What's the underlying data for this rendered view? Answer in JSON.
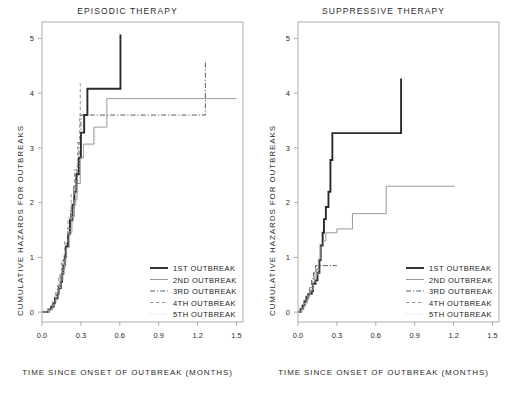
{
  "figure": {
    "axis_label_y": "CUMULATIVE  HAZARDS  FOR  OUTBREAKS",
    "axis_label_x": "TIME SINCE ONSET OF OUTBREAK  (MONTHS)",
    "colors": {
      "series1": "#2a2a2a",
      "series2": "#8c8c8c",
      "series3": "#4a4a4a",
      "series4": "#8a8a8a",
      "series5": "#c8c8c8",
      "frame": "#9a9a9a",
      "text": "#2b2b2b"
    }
  },
  "panels": [
    {
      "key": "episodic",
      "title": "EPISODIC  THERAPY",
      "legend": [
        {
          "label": "1ST  OUTBREAK",
          "style": "solid-thick"
        },
        {
          "label": "2ND  OUTBREAK",
          "style": "solid-thin"
        },
        {
          "label": "3RD  OUTBREAK",
          "style": "dashdot"
        },
        {
          "label": "4TH  OUTBREAK",
          "style": "dashed"
        },
        {
          "label": "5TH  OUTBREAK",
          "style": "dotted"
        }
      ]
    },
    {
      "key": "suppressive",
      "title": "SUPPRESSIVE  THERAPY",
      "legend": [
        {
          "label": "1ST  OUTBREAK",
          "style": "solid-thick"
        },
        {
          "label": "2ND  OUTBREAK",
          "style": "solid-thin"
        },
        {
          "label": "3RD  OUTBREAK",
          "style": "dashdot"
        },
        {
          "label": "4TH  OUTBREAK",
          "style": "dashed"
        },
        {
          "label": "5TH  OUTBREAK",
          "style": "dotted"
        }
      ]
    }
  ],
  "chart_data": [
    {
      "type": "line",
      "subtype": "step",
      "title": "EPISODIC  THERAPY",
      "xlabel": "TIME SINCE ONSET OF OUTBREAK  (MONTHS)",
      "ylabel": "CUMULATIVE  HAZARDS  FOR  OUTBREAKS",
      "xlim": [
        0.0,
        1.55
      ],
      "ylim": [
        -0.18,
        5.3
      ],
      "xticks": [
        0.0,
        0.3,
        0.6,
        0.9,
        1.2,
        1.5
      ],
      "xticklabels": [
        "0.0",
        "0.3",
        "0.6",
        "0.9",
        "1.2",
        "1.5"
      ],
      "yticks": [
        0,
        1,
        2,
        3,
        4,
        5
      ],
      "yticklabels": [
        "0",
        "1",
        "2",
        "3",
        "4",
        "5"
      ],
      "grid": false,
      "legend_position": "lower-right-inside",
      "series": [
        {
          "name": "1ST  OUTBREAK",
          "style": "solid-thick",
          "color": "#2a2a2a",
          "points": [
            [
              0.0,
              0.0
            ],
            [
              0.04,
              0.0
            ],
            [
              0.05,
              0.05
            ],
            [
              0.07,
              0.1
            ],
            [
              0.09,
              0.17
            ],
            [
              0.1,
              0.25
            ],
            [
              0.12,
              0.34
            ],
            [
              0.13,
              0.44
            ],
            [
              0.145,
              0.56
            ],
            [
              0.155,
              0.7
            ],
            [
              0.165,
              0.85
            ],
            [
              0.175,
              1.02
            ],
            [
              0.185,
              1.2
            ],
            [
              0.2,
              1.42
            ],
            [
              0.215,
              1.68
            ],
            [
              0.235,
              1.96
            ],
            [
              0.25,
              2.2
            ],
            [
              0.265,
              2.52
            ],
            [
              0.285,
              2.82
            ],
            [
              0.3,
              3.28
            ],
            [
              0.325,
              3.6
            ],
            [
              0.35,
              4.08
            ],
            [
              0.6,
              4.08
            ],
            [
              0.605,
              5.07
            ]
          ]
        },
        {
          "name": "2ND  OUTBREAK",
          "style": "solid-thin",
          "color": "#8c8c8c",
          "points": [
            [
              0.0,
              0.0
            ],
            [
              0.05,
              0.0
            ],
            [
              0.06,
              0.06
            ],
            [
              0.08,
              0.13
            ],
            [
              0.1,
              0.22
            ],
            [
              0.115,
              0.33
            ],
            [
              0.13,
              0.45
            ],
            [
              0.145,
              0.6
            ],
            [
              0.16,
              0.78
            ],
            [
              0.175,
              0.98
            ],
            [
              0.19,
              1.18
            ],
            [
              0.21,
              1.45
            ],
            [
              0.23,
              1.75
            ],
            [
              0.25,
              2.05
            ],
            [
              0.27,
              2.35
            ],
            [
              0.295,
              2.82
            ],
            [
              0.32,
              3.07
            ],
            [
              0.4,
              3.38
            ],
            [
              0.5,
              3.9
            ],
            [
              1.5,
              3.9
            ]
          ]
        },
        {
          "name": "3RD  OUTBREAK",
          "style": "dashdot",
          "color": "#4a4a4a",
          "points": [
            [
              0.0,
              0.0
            ],
            [
              0.05,
              0.05
            ],
            [
              0.08,
              0.16
            ],
            [
              0.1,
              0.3
            ],
            [
              0.12,
              0.48
            ],
            [
              0.14,
              0.7
            ],
            [
              0.16,
              0.95
            ],
            [
              0.18,
              1.25
            ],
            [
              0.2,
              1.55
            ],
            [
              0.22,
              1.9
            ],
            [
              0.245,
              2.3
            ],
            [
              0.27,
              2.72
            ],
            [
              0.285,
              3.1
            ],
            [
              0.3,
              3.6
            ],
            [
              1.255,
              3.6
            ],
            [
              1.26,
              4.6
            ]
          ]
        },
        {
          "name": "4TH  OUTBREAK",
          "style": "dashed",
          "color": "#8a8a8a",
          "points": [
            [
              0.0,
              0.0
            ],
            [
              0.05,
              0.06
            ],
            [
              0.08,
              0.2
            ],
            [
              0.105,
              0.38
            ],
            [
              0.13,
              0.62
            ],
            [
              0.15,
              0.92
            ],
            [
              0.175,
              1.3
            ],
            [
              0.2,
              1.72
            ],
            [
              0.225,
              2.15
            ],
            [
              0.25,
              2.6
            ],
            [
              0.275,
              3.1
            ],
            [
              0.29,
              3.6
            ],
            [
              0.295,
              4.18
            ]
          ]
        },
        {
          "name": "5TH  OUTBREAK",
          "style": "dotted",
          "color": "#c8c8c8",
          "points": [
            [
              0.0,
              0.0
            ],
            [
              0.06,
              0.05
            ],
            [
              0.09,
              0.18
            ],
            [
              0.115,
              0.35
            ],
            [
              0.14,
              0.58
            ],
            [
              0.165,
              0.86
            ],
            [
              0.19,
              1.18
            ],
            [
              0.215,
              1.55
            ],
            [
              0.24,
              1.95
            ],
            [
              0.265,
              2.4
            ],
            [
              0.29,
              2.8
            ],
            [
              0.32,
              3.05
            ],
            [
              0.41,
              3.38
            ],
            [
              0.5,
              3.4
            ]
          ]
        }
      ]
    },
    {
      "type": "line",
      "subtype": "step",
      "title": "SUPPRESSIVE  THERAPY",
      "xlabel": "TIME SINCE ONSET OF OUTBREAK  (MONTHS)",
      "ylabel": "CUMULATIVE  HAZARDS  FOR  OUTBREAKS",
      "xlim": [
        0.0,
        1.55
      ],
      "ylim": [
        -0.18,
        5.3
      ],
      "xticks": [
        0.0,
        0.3,
        0.6,
        0.9,
        1.2,
        1.5
      ],
      "xticklabels": [
        "0.0",
        "0.3",
        "0.6",
        "0.9",
        "1.2",
        "1.5"
      ],
      "yticks": [
        0,
        1,
        2,
        3,
        4,
        5
      ],
      "yticklabels": [
        "0",
        "1",
        "2",
        "3",
        "4",
        "5"
      ],
      "grid": false,
      "legend_position": "lower-right-inside",
      "series": [
        {
          "name": "1ST  OUTBREAK",
          "style": "solid-thick",
          "color": "#2a2a2a",
          "points": [
            [
              0.0,
              0.0
            ],
            [
              0.015,
              0.0
            ],
            [
              0.02,
              0.06
            ],
            [
              0.035,
              0.12
            ],
            [
              0.05,
              0.2
            ],
            [
              0.065,
              0.28
            ],
            [
              0.08,
              0.33
            ],
            [
              0.105,
              0.38
            ],
            [
              0.115,
              0.52
            ],
            [
              0.135,
              0.58
            ],
            [
              0.15,
              0.72
            ],
            [
              0.165,
              0.95
            ],
            [
              0.175,
              1.22
            ],
            [
              0.19,
              1.45
            ],
            [
              0.2,
              1.7
            ],
            [
              0.215,
              1.92
            ],
            [
              0.235,
              2.2
            ],
            [
              0.25,
              2.78
            ],
            [
              0.265,
              3.27
            ],
            [
              0.79,
              3.27
            ],
            [
              0.795,
              4.27
            ]
          ]
        },
        {
          "name": "2ND  OUTBREAK",
          "style": "solid-thin",
          "color": "#8c8c8c",
          "points": [
            [
              0.0,
              0.0
            ],
            [
              0.02,
              0.0
            ],
            [
              0.03,
              0.07
            ],
            [
              0.045,
              0.15
            ],
            [
              0.06,
              0.23
            ],
            [
              0.08,
              0.31
            ],
            [
              0.095,
              0.4
            ],
            [
              0.115,
              0.55
            ],
            [
              0.13,
              0.66
            ],
            [
              0.145,
              0.78
            ],
            [
              0.16,
              0.97
            ],
            [
              0.175,
              1.2
            ],
            [
              0.195,
              1.3
            ],
            [
              0.215,
              1.45
            ],
            [
              0.3,
              1.52
            ],
            [
              0.42,
              1.8
            ],
            [
              0.68,
              2.3
            ],
            [
              1.21,
              2.3
            ]
          ]
        },
        {
          "name": "3RD  OUTBREAK",
          "style": "dashdot",
          "color": "#4a4a4a",
          "points": [
            [
              0.0,
              0.0
            ],
            [
              0.02,
              0.05
            ],
            [
              0.04,
              0.14
            ],
            [
              0.06,
              0.24
            ],
            [
              0.075,
              0.33
            ],
            [
              0.09,
              0.45
            ],
            [
              0.105,
              0.6
            ],
            [
              0.12,
              0.72
            ],
            [
              0.135,
              0.85
            ],
            [
              0.3,
              0.85
            ]
          ]
        },
        {
          "name": "4TH  OUTBREAK",
          "style": "dashed",
          "color": "#8a8a8a",
          "points": [
            [
              0.0,
              0.0
            ],
            [
              0.02,
              0.06
            ],
            [
              0.045,
              0.18
            ],
            [
              0.07,
              0.3
            ],
            [
              0.09,
              0.45
            ],
            [
              0.11,
              0.62
            ],
            [
              0.13,
              0.78
            ],
            [
              0.15,
              0.84
            ]
          ]
        },
        {
          "name": "5TH  OUTBREAK",
          "style": "dotted",
          "color": "#c8c8c8",
          "points": [
            [
              0.0,
              0.0
            ],
            [
              0.025,
              0.05
            ],
            [
              0.05,
              0.16
            ],
            [
              0.075,
              0.28
            ],
            [
              0.1,
              0.42
            ],
            [
              0.12,
              0.55
            ],
            [
              0.14,
              0.7
            ],
            [
              0.16,
              0.82
            ]
          ]
        }
      ]
    }
  ]
}
